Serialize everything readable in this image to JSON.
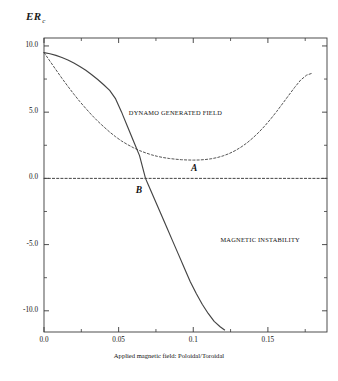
{
  "chart_data": {
    "type": "line",
    "title": "",
    "ylabel": "ER",
    "ylabel_sub": "c",
    "xlabel": "Applied magnetic field: Poloidal/Toroidal",
    "xlim": [
      0.0,
      0.1896
    ],
    "ylim": [
      -11.6,
      10.6
    ],
    "grid": false,
    "legend": "none",
    "xticks": [
      "0.0",
      "0.05",
      "0.1",
      "0.15"
    ],
    "xtick_values": [
      0.0,
      0.05,
      0.1,
      0.15
    ],
    "yticks": [
      "10.0",
      "5.0",
      "0.0",
      "-5.0",
      "-10.0"
    ],
    "ytick_values": [
      10.0,
      5.0,
      0.0,
      -5.0,
      -10.0
    ],
    "minor_ytick_values": [
      7.5,
      2.5,
      -2.5,
      -7.5
    ],
    "minor_xtick_values": [
      0.025,
      0.075,
      0.125,
      0.175
    ],
    "annotations": [
      {
        "text": "DYNAMO GENERATED FIELD",
        "x": 0.088,
        "y": 5.0
      },
      {
        "text": "MAGNETIC INSTABILITY",
        "x": 0.145,
        "y": -4.6
      },
      {
        "text": "A",
        "x": 0.1005,
        "y": 0.75,
        "style": "italic"
      },
      {
        "text": "B",
        "x": 0.0635,
        "y": -0.85,
        "style": "italic"
      }
    ],
    "series": [
      {
        "name": "A",
        "label": "A",
        "style": "dashed",
        "color": "#555555",
        "points": [
          [
            0.0,
            9.5
          ],
          [
            0.004,
            8.85
          ],
          [
            0.008,
            8.2
          ],
          [
            0.012,
            7.56
          ],
          [
            0.016,
            6.95
          ],
          [
            0.02,
            6.36
          ],
          [
            0.024,
            5.8
          ],
          [
            0.028,
            5.28
          ],
          [
            0.032,
            4.78
          ],
          [
            0.036,
            4.32
          ],
          [
            0.04,
            3.9
          ],
          [
            0.044,
            3.5
          ],
          [
            0.048,
            3.14
          ],
          [
            0.052,
            2.82
          ],
          [
            0.056,
            2.55
          ],
          [
            0.06,
            2.31
          ],
          [
            0.064,
            2.1
          ],
          [
            0.068,
            1.93
          ],
          [
            0.072,
            1.78
          ],
          [
            0.076,
            1.66
          ],
          [
            0.08,
            1.57
          ],
          [
            0.084,
            1.5
          ],
          [
            0.088,
            1.45
          ],
          [
            0.092,
            1.41
          ],
          [
            0.096,
            1.39
          ],
          [
            0.1,
            1.38
          ],
          [
            0.104,
            1.39
          ],
          [
            0.108,
            1.42
          ],
          [
            0.112,
            1.48
          ],
          [
            0.116,
            1.57
          ],
          [
            0.12,
            1.7
          ],
          [
            0.124,
            1.87
          ],
          [
            0.128,
            2.09
          ],
          [
            0.132,
            2.36
          ],
          [
            0.136,
            2.68
          ],
          [
            0.14,
            3.06
          ],
          [
            0.144,
            3.49
          ],
          [
            0.148,
            3.97
          ],
          [
            0.152,
            4.5
          ],
          [
            0.156,
            5.07
          ],
          [
            0.16,
            5.67
          ],
          [
            0.164,
            6.28
          ],
          [
            0.168,
            6.88
          ],
          [
            0.172,
            7.43
          ],
          [
            0.176,
            7.8
          ],
          [
            0.18,
            7.95
          ]
        ]
      },
      {
        "name": "B",
        "label": "B",
        "style": "solid",
        "color": "#444444",
        "points": [
          [
            0.0,
            9.5
          ],
          [
            0.004,
            9.41
          ],
          [
            0.008,
            9.29
          ],
          [
            0.012,
            9.13
          ],
          [
            0.016,
            8.94
          ],
          [
            0.02,
            8.71
          ],
          [
            0.024,
            8.45
          ],
          [
            0.028,
            8.16
          ],
          [
            0.032,
            7.83
          ],
          [
            0.036,
            7.47
          ],
          [
            0.04,
            7.07
          ],
          [
            0.044,
            6.64
          ],
          [
            0.048,
            6.0
          ],
          [
            0.052,
            5.0
          ],
          [
            0.053,
            4.72
          ],
          [
            0.056,
            3.9
          ],
          [
            0.06,
            2.8
          ],
          [
            0.064,
            1.72
          ],
          [
            0.068,
            0.0
          ],
          [
            0.07,
            -0.52
          ],
          [
            0.074,
            -1.56
          ],
          [
            0.078,
            -2.6
          ],
          [
            0.082,
            -3.64
          ],
          [
            0.086,
            -4.68
          ],
          [
            0.09,
            -5.72
          ],
          [
            0.094,
            -6.76
          ],
          [
            0.098,
            -7.8
          ],
          [
            0.102,
            -8.7
          ],
          [
            0.106,
            -9.5
          ],
          [
            0.11,
            -10.2
          ],
          [
            0.114,
            -10.8
          ],
          [
            0.118,
            -11.2
          ],
          [
            0.121,
            -11.45
          ]
        ]
      },
      {
        "name": "zero-line",
        "label": "",
        "style": "dashed",
        "color": "#444444",
        "points": [
          [
            0.0,
            0.0
          ],
          [
            0.1896,
            0.0
          ]
        ]
      }
    ]
  }
}
